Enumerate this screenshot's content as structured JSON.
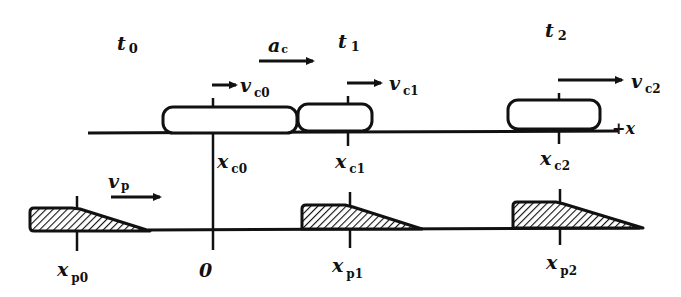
{
  "diagram": {
    "axis_upper": {
      "label": "+x",
      "direction_label_plus": "+",
      "direction_label_var": "x"
    },
    "origin_label": "0",
    "times": [
      {
        "var": "t",
        "sub": "0"
      },
      {
        "var": "t",
        "sub": "1"
      },
      {
        "var": "t",
        "sub": "2"
      }
    ],
    "acceleration": {
      "var": "a",
      "sub": "c"
    },
    "pursuer_velocity": {
      "var": "v",
      "sub": "p"
    },
    "car_velocities": [
      {
        "var": "v",
        "sub": "c0"
      },
      {
        "var": "v",
        "sub": "c1"
      },
      {
        "var": "v",
        "sub": "c2"
      }
    ],
    "car_positions": [
      {
        "var": "x",
        "sub": "c0"
      },
      {
        "var": "x",
        "sub": "c1"
      },
      {
        "var": "x",
        "sub": "c2"
      }
    ],
    "pursuer_positions": [
      {
        "var": "x",
        "sub": "p0"
      },
      {
        "var": "x",
        "sub": "p1"
      },
      {
        "var": "x",
        "sub": "p2"
      }
    ],
    "colors": {
      "ink": "#111111",
      "background": "#ffffff",
      "hatch": "#111111"
    }
  }
}
